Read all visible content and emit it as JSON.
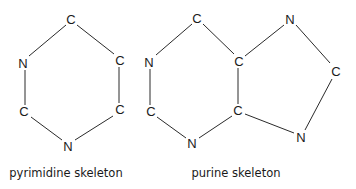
{
  "diagram": {
    "pyrimidine": {
      "caption": "pyrimidine skeleton",
      "atoms": [
        {
          "id": "c_top",
          "label": "C"
        },
        {
          "id": "n_left",
          "label": "N"
        },
        {
          "id": "c_right_top",
          "label": "C"
        },
        {
          "id": "c_left_bottom",
          "label": "C"
        },
        {
          "id": "c_right_bottom",
          "label": "C"
        },
        {
          "id": "n_bottom",
          "label": "N"
        }
      ]
    },
    "purine": {
      "caption": "purine skeleton",
      "atoms": [
        {
          "id": "c_top",
          "label": "C"
        },
        {
          "id": "n_left",
          "label": "N"
        },
        {
          "id": "c_center_top",
          "label": "C"
        },
        {
          "id": "c_left_bottom",
          "label": "C"
        },
        {
          "id": "c_center_bottom",
          "label": "C"
        },
        {
          "id": "n_bottom",
          "label": "N"
        },
        {
          "id": "n_top_right",
          "label": "N"
        },
        {
          "id": "c_right",
          "label": "C"
        },
        {
          "id": "n_bottom_right",
          "label": "N"
        }
      ]
    }
  }
}
